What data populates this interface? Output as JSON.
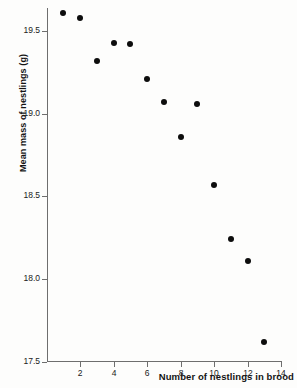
{
  "chart_data": {
    "type": "scatter",
    "title": "",
    "xlabel": "Number of nestlings in brood",
    "ylabel": "Mean mass of nestlings (g)",
    "xlim": [
      0.3,
      14.0
    ],
    "ylim": [
      17.5,
      19.65
    ],
    "grid": false,
    "legend": "none",
    "x_ticks": [
      2,
      4,
      6,
      8,
      10,
      12,
      14
    ],
    "x_tick_labels": [
      "2",
      "4",
      "6",
      "8",
      "10",
      "12",
      "14"
    ],
    "y_ticks": [
      17.5,
      18.0,
      18.5,
      19.0,
      19.5
    ],
    "y_tick_labels": [
      "17.5",
      "18.0",
      "18.5",
      "19.0",
      "19.5"
    ],
    "marker": "filled-circle",
    "marker_color": "#0d0d0d",
    "axis_color": "#6e6e6e",
    "x": [
      1,
      2,
      3,
      4,
      5,
      6,
      7,
      8,
      9,
      10,
      11,
      12,
      13
    ],
    "y": [
      19.61,
      19.58,
      19.32,
      19.43,
      19.42,
      19.21,
      19.07,
      18.86,
      19.06,
      18.57,
      18.24,
      18.11,
      17.62
    ],
    "points": [
      {
        "x": 1,
        "y": 19.61
      },
      {
        "x": 2,
        "y": 19.58
      },
      {
        "x": 3,
        "y": 19.32
      },
      {
        "x": 4,
        "y": 19.43
      },
      {
        "x": 5,
        "y": 19.42
      },
      {
        "x": 6,
        "y": 19.21
      },
      {
        "x": 7,
        "y": 19.07
      },
      {
        "x": 8,
        "y": 18.86
      },
      {
        "x": 9,
        "y": 19.06
      },
      {
        "x": 10,
        "y": 18.57
      },
      {
        "x": 11,
        "y": 18.24
      },
      {
        "x": 12,
        "y": 18.11
      },
      {
        "x": 13,
        "y": 17.62
      }
    ]
  }
}
